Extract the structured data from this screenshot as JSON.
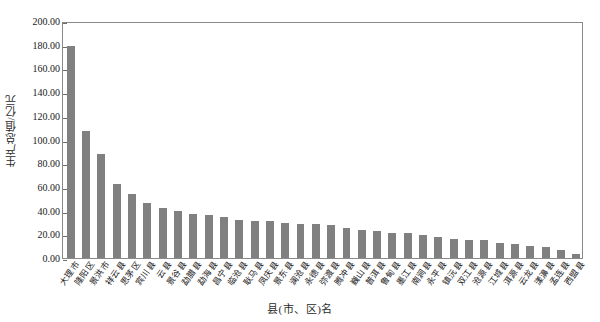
{
  "chart_data": {
    "type": "bar",
    "title": "",
    "xlabel": "县(市、区)名",
    "ylabel": "生产总值/亿元",
    "ylim": [
      0,
      200
    ],
    "ytick_step": 20,
    "grid": false,
    "legend": null,
    "bar_color": "#808080",
    "axis_color": "#8a8a8a",
    "yticks": [
      "200.00",
      "180.00",
      "160.00",
      "140.00",
      "120.00",
      "100.00",
      "80.00",
      "60.00",
      "40.00",
      "20.00",
      "0.00"
    ],
    "categories": [
      "大理市",
      "隆阳区",
      "景洪市",
      "祥云县",
      "思茅区",
      "宾川县",
      "云县",
      "景谷县",
      "勐腊县",
      "勐海县",
      "昌宁县",
      "临沧县",
      "耿马县",
      "凤庆县",
      "景东县",
      "澜沧县",
      "永德县",
      "弥渡县",
      "腾冲县",
      "巍山县",
      "普洱县",
      "鲁甸县",
      "墨江县",
      "南涧县",
      "永平县",
      "镇沅县",
      "双江县",
      "沧源县",
      "江城县",
      "洱源县",
      "云龙县",
      "漾濞县",
      "孟连县",
      "西盟县"
    ],
    "values": [
      179.0,
      106.8,
      87.5,
      62.5,
      54.0,
      46.5,
      42.0,
      39.5,
      37.5,
      36.5,
      34.5,
      32.0,
      31.5,
      31.5,
      29.5,
      28.5,
      28.5,
      27.5,
      25.0,
      24.0,
      23.0,
      21.5,
      21.0,
      19.5,
      17.5,
      16.0,
      15.5,
      15.0,
      13.0,
      11.5,
      10.5,
      9.0,
      7.0,
      3.0
    ]
  }
}
